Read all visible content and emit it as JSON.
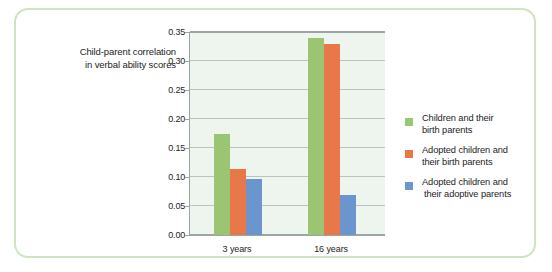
{
  "figure": {
    "frame_color": "#cfe3c2",
    "background": "#ffffff"
  },
  "y_axis_title": {
    "line1": "Child-parent correlation",
    "line2": "in verbal ability scores"
  },
  "legend": {
    "entries": [
      {
        "color": "#9cc573",
        "line1": "Children and their",
        "line2": "birth parents"
      },
      {
        "color": "#e8784a",
        "line1": "Adopted children and",
        "line2": "their birth parents"
      },
      {
        "color": "#6b95cc",
        "line1": "Adopted children and",
        "line2": "their adoptive parents"
      }
    ]
  },
  "chart_data": {
    "type": "bar",
    "title": "",
    "subtitle": "",
    "xlabel": "",
    "ylabel": "Child-parent correlation in verbal ability scores",
    "categories": [
      "3 years",
      "16 years"
    ],
    "series": [
      {
        "name": "Children and their birth parents",
        "color": "#9cc573",
        "values": [
          0.175,
          0.34
        ]
      },
      {
        "name": "Adopted children and their birth parents",
        "color": "#e8784a",
        "values": [
          0.113,
          0.33
        ]
      },
      {
        "name": "Adopted children and their adoptive parents",
        "color": "#6b95cc",
        "values": [
          0.097,
          0.069
        ]
      }
    ],
    "ylim": [
      0.0,
      0.35
    ],
    "ytick_values": [
      0.0,
      0.05,
      0.1,
      0.15,
      0.2,
      0.25,
      0.3,
      0.35
    ],
    "ytick_labels": [
      "0.00",
      "0.05",
      "0.10",
      "0.15",
      "0.20",
      "0.25",
      "0.30",
      "0.35"
    ],
    "grid": true,
    "grid_axis": "y",
    "legend_position": "right",
    "plot_background": "#edf5ee",
    "gridline_color": "#b9c4be",
    "axis_color": "#9aa6a0"
  }
}
